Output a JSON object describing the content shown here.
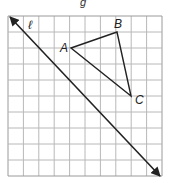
{
  "figure": {
    "caption_fragment": "g",
    "grid": {
      "cols": 10,
      "rows": 10,
      "x0": 8,
      "y0": 16,
      "cell_w": 15.4,
      "cell_h": 16,
      "line_color": "#b8b8b8",
      "border_color": "#9a9a9a"
    },
    "line": {
      "label": "ℓ",
      "from": [
        10,
        17
      ],
      "to": [
        160,
        176
      ],
      "color": "#222222",
      "arrows": "both"
    },
    "triangle": {
      "color": "#222222",
      "vertices": [
        {
          "name": "A",
          "x": 71,
          "y": 48
        },
        {
          "name": "B",
          "x": 117,
          "y": 32
        },
        {
          "name": "C",
          "x": 131,
          "y": 96
        }
      ]
    }
  }
}
